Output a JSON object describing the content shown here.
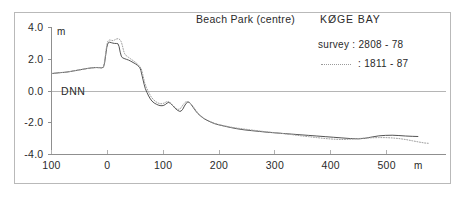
{
  "figure": {
    "title_left": "Beach Park  (centre)",
    "title_right": "KØGE BAY",
    "datum_label": "DNN"
  },
  "legend": {
    "row1": "survey :  2808 - 78",
    "row2": ":  1811 - 87",
    "row1_name": "survey : 2808-78",
    "row2_name": ": 1811-87"
  },
  "axes": {
    "y_unit": "m",
    "x_unit": "m",
    "y_ticks": [
      "4.0",
      "2.0",
      "0.0",
      "-2.0",
      "-4.0"
    ],
    "x_ticks": [
      "100",
      "0",
      "100",
      "200",
      "300",
      "400",
      "500"
    ]
  },
  "colors": {
    "frame": "#b9b9b9",
    "axis": "#8f8f8f",
    "series_solid": "#4a4a4a",
    "series_dotted": "#a0a0a0",
    "text": "#2a2a2a",
    "background": "#ffffff"
  },
  "chart_data": {
    "type": "line",
    "xlabel": "m",
    "ylabel": "m",
    "xlim": [
      -100,
      575
    ],
    "ylim": [
      -4.0,
      4.0
    ],
    "grid": false,
    "legend_position": "top-right",
    "annotations": [
      "DNN (datum) at y = 0.0"
    ],
    "x_tick_values": [
      -100,
      0,
      100,
      200,
      300,
      400,
      500
    ],
    "x_tick_labels": [
      "100",
      "0",
      "100",
      "200",
      "300",
      "400",
      "500"
    ],
    "y_tick_values": [
      4.0,
      2.0,
      0.0,
      -2.0,
      -4.0
    ],
    "y_tick_labels": [
      "4.0",
      "2.0",
      "0.0",
      "-2.0",
      "-4.0"
    ],
    "series": [
      {
        "name": "survey : 2808-78",
        "style": "solid",
        "color": "#4a4a4a",
        "points": [
          [
            -100,
            1.1
          ],
          [
            -92,
            1.13
          ],
          [
            -84,
            1.16
          ],
          [
            -76,
            1.18
          ],
          [
            -68,
            1.22
          ],
          [
            -60,
            1.27
          ],
          [
            -52,
            1.32
          ],
          [
            -44,
            1.37
          ],
          [
            -36,
            1.42
          ],
          [
            -28,
            1.46
          ],
          [
            -20,
            1.48
          ],
          [
            -14,
            1.47
          ],
          [
            -10,
            1.46
          ],
          [
            -7,
            1.5
          ],
          [
            -5,
            1.75
          ],
          [
            -3,
            2.25
          ],
          [
            -1,
            2.75
          ],
          [
            1,
            3.02
          ],
          [
            4,
            3.08
          ],
          [
            7,
            3.05
          ],
          [
            10,
            3.02
          ],
          [
            13,
            3.0
          ],
          [
            16,
            3.0
          ],
          [
            19,
            2.98
          ],
          [
            21,
            2.8
          ],
          [
            23,
            2.45
          ],
          [
            25,
            2.2
          ],
          [
            27,
            2.1
          ],
          [
            30,
            2.05
          ],
          [
            34,
            2.0
          ],
          [
            38,
            1.95
          ],
          [
            42,
            1.88
          ],
          [
            46,
            1.8
          ],
          [
            50,
            1.72
          ],
          [
            54,
            1.62
          ],
          [
            58,
            1.48
          ],
          [
            60,
            1.3
          ],
          [
            62,
            1.0
          ],
          [
            64,
            0.7
          ],
          [
            66,
            0.4
          ],
          [
            68,
            0.15
          ],
          [
            71,
            -0.1
          ],
          [
            74,
            -0.32
          ],
          [
            77,
            -0.5
          ],
          [
            80,
            -0.64
          ],
          [
            84,
            -0.76
          ],
          [
            88,
            -0.84
          ],
          [
            92,
            -0.9
          ],
          [
            96,
            -0.93
          ],
          [
            100,
            -0.92
          ],
          [
            104,
            -0.85
          ],
          [
            107,
            -0.76
          ],
          [
            110,
            -0.72
          ],
          [
            113,
            -0.78
          ],
          [
            117,
            -0.92
          ],
          [
            121,
            -1.08
          ],
          [
            125,
            -1.2
          ],
          [
            129,
            -1.28
          ],
          [
            132,
            -1.27
          ],
          [
            135,
            -1.15
          ],
          [
            138,
            -0.95
          ],
          [
            141,
            -0.78
          ],
          [
            144,
            -0.7
          ],
          [
            147,
            -0.72
          ],
          [
            150,
            -0.85
          ],
          [
            154,
            -1.05
          ],
          [
            158,
            -1.25
          ],
          [
            162,
            -1.42
          ],
          [
            167,
            -1.58
          ],
          [
            172,
            -1.72
          ],
          [
            178,
            -1.84
          ],
          [
            185,
            -1.96
          ],
          [
            192,
            -2.06
          ],
          [
            200,
            -2.14
          ],
          [
            210,
            -2.22
          ],
          [
            220,
            -2.3
          ],
          [
            232,
            -2.38
          ],
          [
            245,
            -2.45
          ],
          [
            258,
            -2.5
          ],
          [
            272,
            -2.55
          ],
          [
            286,
            -2.6
          ],
          [
            300,
            -2.64
          ],
          [
            315,
            -2.68
          ],
          [
            330,
            -2.72
          ],
          [
            345,
            -2.76
          ],
          [
            360,
            -2.8
          ],
          [
            375,
            -2.84
          ],
          [
            390,
            -2.88
          ],
          [
            405,
            -2.92
          ],
          [
            420,
            -2.96
          ],
          [
            435,
            -3.0
          ],
          [
            450,
            -3.02
          ],
          [
            462,
            -2.98
          ],
          [
            474,
            -2.9
          ],
          [
            486,
            -2.83
          ],
          [
            498,
            -2.8
          ],
          [
            510,
            -2.79
          ],
          [
            522,
            -2.81
          ],
          [
            534,
            -2.84
          ],
          [
            546,
            -2.86
          ],
          [
            556,
            -2.87
          ]
        ]
      },
      {
        "name": ": 1811-87",
        "style": "dotted",
        "color": "#a0a0a0",
        "points": [
          [
            -100,
            1.1
          ],
          [
            -92,
            1.13
          ],
          [
            -84,
            1.16
          ],
          [
            -76,
            1.18
          ],
          [
            -68,
            1.22
          ],
          [
            -60,
            1.27
          ],
          [
            -52,
            1.32
          ],
          [
            -44,
            1.37
          ],
          [
            -36,
            1.42
          ],
          [
            -28,
            1.46
          ],
          [
            -20,
            1.48
          ],
          [
            -14,
            1.47
          ],
          [
            -10,
            1.46
          ],
          [
            -7,
            1.52
          ],
          [
            -5,
            1.85
          ],
          [
            -3,
            2.4
          ],
          [
            -1,
            2.9
          ],
          [
            1,
            3.15
          ],
          [
            4,
            3.22
          ],
          [
            7,
            3.2
          ],
          [
            10,
            3.18
          ],
          [
            13,
            3.22
          ],
          [
            16,
            3.28
          ],
          [
            19,
            3.3
          ],
          [
            21,
            3.28
          ],
          [
            23,
            3.22
          ],
          [
            25,
            3.1
          ],
          [
            27,
            2.85
          ],
          [
            29,
            2.55
          ],
          [
            31,
            2.35
          ],
          [
            34,
            2.22
          ],
          [
            38,
            2.12
          ],
          [
            42,
            2.02
          ],
          [
            46,
            1.92
          ],
          [
            50,
            1.82
          ],
          [
            54,
            1.7
          ],
          [
            58,
            1.55
          ],
          [
            61,
            1.38
          ],
          [
            63,
            1.1
          ],
          [
            65,
            0.8
          ],
          [
            67,
            0.5
          ],
          [
            70,
            0.22
          ],
          [
            73,
            -0.02
          ],
          [
            76,
            -0.22
          ],
          [
            79,
            -0.4
          ],
          [
            83,
            -0.56
          ],
          [
            87,
            -0.68
          ],
          [
            91,
            -0.76
          ],
          [
            95,
            -0.8
          ],
          [
            99,
            -0.8
          ],
          [
            103,
            -0.74
          ],
          [
            106,
            -0.68
          ],
          [
            109,
            -0.66
          ],
          [
            112,
            -0.72
          ],
          [
            116,
            -0.86
          ],
          [
            120,
            -1.0
          ],
          [
            124,
            -1.12
          ],
          [
            128,
            -1.16
          ],
          [
            131,
            -1.1
          ],
          [
            134,
            -0.95
          ],
          [
            137,
            -0.8
          ],
          [
            140,
            -0.7
          ],
          [
            143,
            -0.66
          ],
          [
            146,
            -0.7
          ],
          [
            150,
            -0.82
          ],
          [
            154,
            -1.0
          ],
          [
            158,
            -1.2
          ],
          [
            162,
            -1.38
          ],
          [
            167,
            -1.55
          ],
          [
            172,
            -1.7
          ],
          [
            178,
            -1.82
          ],
          [
            185,
            -1.94
          ],
          [
            192,
            -2.04
          ],
          [
            200,
            -2.12
          ],
          [
            210,
            -2.2
          ],
          [
            220,
            -2.27
          ],
          [
            232,
            -2.34
          ],
          [
            245,
            -2.4
          ],
          [
            258,
            -2.46
          ],
          [
            272,
            -2.52
          ],
          [
            286,
            -2.58
          ],
          [
            300,
            -2.63
          ],
          [
            315,
            -2.69
          ],
          [
            330,
            -2.75
          ],
          [
            345,
            -2.82
          ],
          [
            360,
            -2.88
          ],
          [
            375,
            -2.94
          ],
          [
            390,
            -3.0
          ],
          [
            405,
            -3.04
          ],
          [
            420,
            -3.06
          ],
          [
            435,
            -3.04
          ],
          [
            450,
            -3.0
          ],
          [
            462,
            -2.97
          ],
          [
            474,
            -2.95
          ],
          [
            486,
            -2.94
          ],
          [
            498,
            -2.94
          ],
          [
            510,
            -2.96
          ],
          [
            522,
            -3.0
          ],
          [
            534,
            -3.06
          ],
          [
            546,
            -3.14
          ],
          [
            558,
            -3.22
          ],
          [
            568,
            -3.28
          ],
          [
            575,
            -3.3
          ]
        ]
      }
    ]
  }
}
